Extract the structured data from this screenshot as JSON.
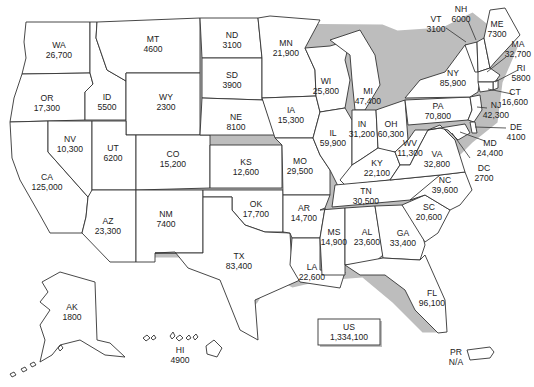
{
  "map": {
    "type": "us-state-choropleth-labels",
    "total": {
      "abbr": "US",
      "value": "1,334,100"
    },
    "states": {
      "WA": {
        "abbr": "WA",
        "value": "26,700"
      },
      "OR": {
        "abbr": "OR",
        "value": "17,300"
      },
      "CA": {
        "abbr": "CA",
        "value": "125,000"
      },
      "ID": {
        "abbr": "ID",
        "value": "5500"
      },
      "NV": {
        "abbr": "NV",
        "value": "10,300"
      },
      "MT": {
        "abbr": "MT",
        "value": "4600"
      },
      "WY": {
        "abbr": "WY",
        "value": "2300"
      },
      "UT": {
        "abbr": "UT",
        "value": "6200"
      },
      "AZ": {
        "abbr": "AZ",
        "value": "23,300"
      },
      "CO": {
        "abbr": "CO",
        "value": "15,200"
      },
      "NM": {
        "abbr": "NM",
        "value": "7400"
      },
      "ND": {
        "abbr": "ND",
        "value": "3100"
      },
      "SD": {
        "abbr": "SD",
        "value": "3900"
      },
      "NE": {
        "abbr": "NE",
        "value": "8100"
      },
      "KS": {
        "abbr": "KS",
        "value": "12,600"
      },
      "OK": {
        "abbr": "OK",
        "value": "17,700"
      },
      "TX": {
        "abbr": "TX",
        "value": "83,400"
      },
      "MN": {
        "abbr": "MN",
        "value": "21,900"
      },
      "IA": {
        "abbr": "IA",
        "value": "15,300"
      },
      "MO": {
        "abbr": "MO",
        "value": "29,500"
      },
      "AR": {
        "abbr": "AR",
        "value": "14,700"
      },
      "LA": {
        "abbr": "LA",
        "value": "22,600"
      },
      "WI": {
        "abbr": "WI",
        "value": "25,800"
      },
      "IL": {
        "abbr": "IL",
        "value": "59,900"
      },
      "MI": {
        "abbr": "MI",
        "value": "47,400"
      },
      "IN": {
        "abbr": "IN",
        "value": "31,200"
      },
      "OH": {
        "abbr": "OH",
        "value": "60,300"
      },
      "KY": {
        "abbr": "KY",
        "value": "22,100"
      },
      "TN": {
        "abbr": "TN",
        "value": "30,500"
      },
      "MS": {
        "abbr": "MS",
        "value": "14,900"
      },
      "AL": {
        "abbr": "AL",
        "value": "23,600"
      },
      "GA": {
        "abbr": "GA",
        "value": "33,400"
      },
      "FL": {
        "abbr": "FL",
        "value": "96,100"
      },
      "SC": {
        "abbr": "SC",
        "value": "20,600"
      },
      "NC": {
        "abbr": "NC",
        "value": "39,600"
      },
      "VA": {
        "abbr": "VA",
        "value": "32,800"
      },
      "WV": {
        "abbr": "WV",
        "value": "11,300"
      },
      "PA": {
        "abbr": "PA",
        "value": "70,800"
      },
      "NY": {
        "abbr": "NY",
        "value": "85,900"
      },
      "VT": {
        "abbr": "VT",
        "value": "3100"
      },
      "NH": {
        "abbr": "NH",
        "value": "6000"
      },
      "ME": {
        "abbr": "ME",
        "value": "7300"
      },
      "MA": {
        "abbr": "MA",
        "value": "32,700"
      },
      "RI": {
        "abbr": "RI",
        "value": "5800"
      },
      "CT": {
        "abbr": "CT",
        "value": "16,600"
      },
      "NJ": {
        "abbr": "NJ",
        "value": "42,300"
      },
      "DE": {
        "abbr": "DE",
        "value": "4100"
      },
      "MD": {
        "abbr": "MD",
        "value": "24,400"
      },
      "DC": {
        "abbr": "DC",
        "value": "2700"
      },
      "AK": {
        "abbr": "AK",
        "value": "1800"
      },
      "HI": {
        "abbr": "HI",
        "value": "4900"
      },
      "PR": {
        "abbr": "PR",
        "value": "N/A"
      }
    }
  }
}
